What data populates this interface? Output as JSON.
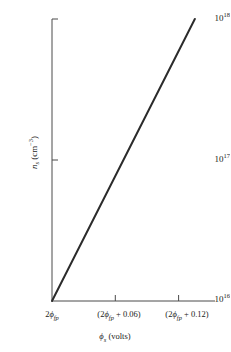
{
  "figure": {
    "background_color": "#ffffff",
    "axis_color": "#4a4a4a",
    "line_color": "#2b2b2b"
  },
  "axes": {
    "y": {
      "title_symbol": "n",
      "title_subscript": "s",
      "title_unit_open": " (cm",
      "title_unit_exp": "−3",
      "title_unit_close": ")",
      "title_plain": "n_s (cm^-3)",
      "ticks": [
        {
          "mantissa": "10",
          "exponent": "18",
          "plain": "10^18",
          "value": 1e+18
        },
        {
          "mantissa": "10",
          "exponent": "17",
          "plain": "10^17",
          "value": 1e+17
        },
        {
          "mantissa": "10",
          "exponent": "16",
          "plain": "10^16",
          "value": 1e+16
        }
      ]
    },
    "x": {
      "title_symbol": "ϕ",
      "title_subscript": "s",
      "title_unit": " (volts)",
      "title_plain": "ϕ_s (volts)",
      "ticks": [
        {
          "plain": "2ϕ_fp",
          "prefix": "2",
          "symbol": "ϕ",
          "subscript": "fp",
          "suffix": "",
          "offset": 0.0
        },
        {
          "plain": "(2ϕ_fp + 0.06)",
          "prefix": "(2",
          "symbol": "ϕ",
          "subscript": "fp",
          "suffix": " + 0.06)",
          "offset": 0.06
        },
        {
          "plain": "(2ϕ_fp + 0.12)",
          "prefix": "(2",
          "symbol": "ϕ",
          "subscript": "fp",
          "suffix": " + 0.12)",
          "offset": 0.12
        }
      ]
    }
  },
  "chart_data": {
    "type": "line",
    "title": "",
    "subtitle": "",
    "xlabel": "ϕ_s (volts)",
    "ylabel": "n_s (cm^-3)",
    "yscale": "log",
    "xscale": "linear",
    "grid": false,
    "legend": null,
    "xlim": [
      0.0,
      0.1545
    ],
    "ylim": [
      1e+16,
      1e+18
    ],
    "xtick_values": [
      0.0,
      0.06,
      0.12
    ],
    "xtick_labels": [
      "2ϕ_fp",
      "(2ϕ_fp + 0.06)",
      "(2ϕ_fp + 0.12)"
    ],
    "ytick_values": [
      1e+16,
      1e+17,
      1e+18
    ],
    "ytick_labels": [
      "10^16",
      "10^17",
      "10^18"
    ],
    "series": [
      {
        "name": "inversion layer electron density",
        "x": [
          0.0,
          0.015,
          0.03,
          0.045,
          0.06,
          0.075,
          0.09,
          0.105,
          0.12,
          0.135
        ],
        "y": [
          1e+16,
          1.47e+16,
          2.15e+16,
          3.16e+16,
          4.64e+16,
          6.81e+16,
          1e+17,
          1.47e+17,
          2.15e+17,
          3.16e+17
        ],
        "x_full": [
          0.0,
          0.1354
        ],
        "y_full": [
          1e+16,
          1e+18
        ],
        "description": "straight line on semi-log axes from (2ϕ_fp, 1e16) to (2ϕ_fp + 0.135, 1e18)",
        "decades_per_volt": 14.77
      }
    ]
  }
}
